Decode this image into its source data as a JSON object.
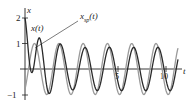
{
  "chart_data": {
    "type": "line",
    "title": "",
    "xlabel": "t",
    "ylabel": "x",
    "ylim": [
      -1.1,
      2.1
    ],
    "xlim": [
      0,
      12.5
    ],
    "y_ticks": [
      {
        "value": 2,
        "label": "2"
      },
      {
        "value": 1,
        "label": "1"
      },
      {
        "value": -1,
        "label": "-1"
      }
    ],
    "x_ticks": [
      {
        "value": 5,
        "label": "5"
      },
      {
        "value": 10,
        "label": "10"
      }
    ],
    "grid": false,
    "series": [
      {
        "name": "x(t)",
        "label": "x(t)",
        "color": "#2a2a2a",
        "description": "transient plus steady periodic solution; starts at 2, decays to steady oscillation"
      },
      {
        "name": "x_sp(t)",
        "label": "x_sp(t)",
        "color": "#9a9a9a",
        "description": "steady periodic solution, amplitude ~1"
      }
    ],
    "annotations": [
      {
        "text": "x(t)",
        "target": "x(t)"
      },
      {
        "text": "x_sp(t)",
        "target": "x_sp(t)"
      }
    ]
  },
  "labels": {
    "y_axis": "x",
    "x_axis": "t",
    "y2": "2",
    "y1": "1",
    "ym1": "−1",
    "x5": "5",
    "x10": "10",
    "series_x": "x(t)",
    "series_xsp_main": "x",
    "series_xsp_sub": "sp",
    "series_xsp_arg": "(t)"
  }
}
